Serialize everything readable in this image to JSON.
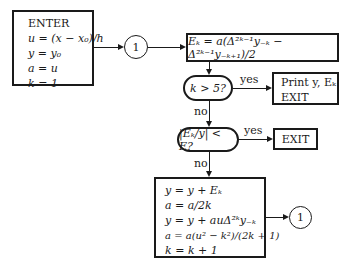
{
  "enter_box": {
    "title": "ENTER",
    "lines": [
      "u = (x − x₀)/h",
      "y = y₀",
      "a = u",
      "k = 1"
    ]
  },
  "connector_top": {
    "label": "1"
  },
  "ek_box": {
    "formula": "Eₖ = a(Δ²ᵏ⁻¹y₋ₖ − Δ²ᵏ⁻¹y₋ₖ₊₁)/2"
  },
  "decision1": {
    "condition": "k > 5?",
    "yes_label": "yes",
    "no_label": "no"
  },
  "print_box": {
    "lines": [
      "Print y, Eₖ",
      "EXIT"
    ]
  },
  "decision2": {
    "condition": "|Eₖ/y| < E?",
    "yes_label": "yes",
    "no_label": "no"
  },
  "exit_box": {
    "label": "EXIT"
  },
  "update_box": {
    "lines": [
      "y = y + Eₖ",
      "a = a/2k",
      "y = y + auΔ²ᵏy₋ₖ",
      "a = a(u² − k²)/(2k + 1)",
      "k = k + 1"
    ]
  },
  "connector_bottom": {
    "label": "1"
  }
}
